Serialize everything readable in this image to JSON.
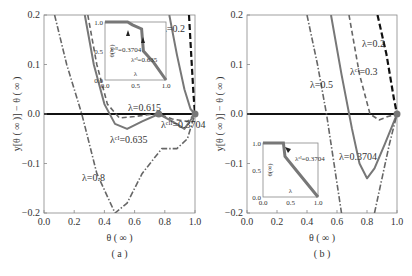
{
  "chart_data": [
    {
      "panel": "(a)",
      "type": "line",
      "xlabel": "θ (∞)",
      "ylabel": "y[θ(∞)] − θ(∞)",
      "xlim": [
        0.0,
        1.0
      ],
      "ylim": [
        -0.2,
        0.2
      ],
      "xticks": [
        "0.0",
        "0.2",
        "0.4",
        "0.6",
        "0.8",
        "1.0"
      ],
      "yticks": [
        "0.2",
        "0.1",
        "0.0",
        "-0.1",
        "-0.2"
      ],
      "grid": false,
      "series": [
        {
          "name": "λ=0.2",
          "style": "dashed-black",
          "x": [
            0.96,
            0.975,
            0.99,
            1.0
          ],
          "y": [
            0.2,
            0.12,
            0.04,
            0.0
          ]
        },
        {
          "name": "λ_c^II=0.3704",
          "style": "solid-gray",
          "x": [
            0.83,
            0.88,
            0.93,
            0.97,
            1.0
          ],
          "y": [
            0.2,
            0.12,
            0.05,
            0.01,
            0.0
          ]
        },
        {
          "name": "λ=0.615",
          "style": "dashed-gray",
          "x": [
            0.29,
            0.35,
            0.42,
            0.5,
            0.6,
            0.7,
            0.76,
            0.85,
            0.95,
            1.0
          ],
          "y": [
            0.2,
            0.1,
            0.02,
            -0.008,
            -0.005,
            -0.001,
            0.0,
            -0.01,
            -0.015,
            0.0
          ]
        },
        {
          "name": "λ_c^I=0.635",
          "style": "solid-gray",
          "x": [
            0.27,
            0.33,
            0.4,
            0.47,
            0.55,
            0.65,
            0.76,
            0.85,
            0.93,
            1.0
          ],
          "y": [
            0.2,
            0.1,
            0.02,
            -0.02,
            -0.03,
            -0.015,
            0.0,
            -0.015,
            -0.03,
            0.0
          ]
        },
        {
          "name": "λ=0.8",
          "style": "dashdot-gray",
          "x": [
            0.07,
            0.15,
            0.25,
            0.35,
            0.47,
            0.55,
            0.65,
            0.78,
            0.88,
            0.95,
            1.0
          ],
          "y": [
            0.2,
            0.1,
            0.0,
            -0.12,
            -0.2,
            -0.18,
            -0.12,
            -0.07,
            -0.07,
            -0.05,
            0.0
          ]
        }
      ],
      "markers": [
        {
          "x": 0.76,
          "y": 0.0
        },
        {
          "x": 1.0,
          "y": 0.0
        }
      ],
      "annotations": [
        "λ=0.2",
        "λ_c^II=0.3704",
        "λ=0.615",
        "λ_c^I=0.635",
        "λ=0.8"
      ],
      "inset": {
        "xlabel": "λ",
        "ylabel": "θ(∞)",
        "xticks": [
          "0.0",
          "0.5",
          "1.0"
        ],
        "yticks": [
          "0.0",
          "0.5",
          "1.0"
        ],
        "x": [
          0.0,
          0.37,
          0.45,
          0.6,
          0.63,
          0.8,
          1.0
        ],
        "y": [
          1.0,
          1.0,
          0.95,
          0.88,
          0.5,
          0.3,
          0.0
        ],
        "annotations": [
          "λ_c^II=0.3704",
          "λ_c^I=0.635"
        ]
      }
    },
    {
      "panel": "(b)",
      "type": "line",
      "xlabel": "θ (∞)",
      "ylabel": "y[θ(∞)] − θ(∞)",
      "xlim": [
        0.0,
        1.0
      ],
      "ylim": [
        -0.2,
        0.2
      ],
      "xticks": [
        "0.0",
        "0.2",
        "0.4",
        "0.6",
        "0.8",
        "1.0"
      ],
      "yticks": [
        "0.2",
        "0.1",
        "0.0",
        "-0.1",
        "-0.2"
      ],
      "grid": false,
      "series": [
        {
          "name": "λ=0.2",
          "style": "dashed-black",
          "x": [
            0.87,
            0.93,
            0.98,
            1.0
          ],
          "y": [
            0.2,
            0.12,
            0.03,
            0.0
          ]
        },
        {
          "name": "λ_c^I=0.3",
          "style": "dashed-gray",
          "x": [
            0.68,
            0.75,
            0.82,
            0.88,
            0.94,
            1.0
          ],
          "y": [
            0.2,
            0.08,
            0.0,
            -0.012,
            -0.005,
            0.0
          ]
        },
        {
          "name": "λ=0.3704",
          "style": "solid-gray",
          "x": [
            0.56,
            0.63,
            0.7,
            0.75,
            0.8,
            0.85,
            0.92,
            1.0
          ],
          "y": [
            0.2,
            0.08,
            -0.03,
            -0.1,
            -0.13,
            -0.11,
            -0.06,
            0.0
          ]
        },
        {
          "name": "λ=0.5",
          "style": "dashdot-gray",
          "x": [
            0.4,
            0.47,
            0.53,
            0.58,
            0.63
          ],
          "y": [
            0.2,
            0.1,
            0.0,
            -0.1,
            -0.2
          ]
        },
        {
          "name": "λ=0.5 (right branch)",
          "style": "dashdot-gray",
          "x": [
            0.85,
            0.9,
            0.95,
            1.0
          ],
          "y": [
            -0.2,
            -0.13,
            -0.06,
            0.0
          ]
        }
      ],
      "markers": [
        {
          "x": 1.0,
          "y": 0.0
        }
      ],
      "annotations": [
        "λ=0.2",
        "λ_c^I=0.3",
        "λ=0.5",
        "λ=0.3704"
      ],
      "inset": {
        "xlabel": "λ",
        "ylabel": "θ(∞)",
        "xticks": [
          "0.0",
          "0.5",
          "1.0"
        ],
        "yticks": [
          "0.0",
          "0.5",
          "1.0"
        ],
        "x": [
          0.0,
          0.37,
          0.4,
          0.6,
          0.8,
          1.0
        ],
        "y": [
          1.0,
          1.0,
          0.75,
          0.5,
          0.25,
          0.0
        ],
        "annotations": [
          "λ_c^I=0.3704"
        ]
      }
    }
  ],
  "labels": {
    "panel_a": "( a )",
    "panel_b": "( b )",
    "xlabel": "θ ( ∞ )",
    "ylabel": "y[θ ( ∞ )] − θ ( ∞ )"
  }
}
